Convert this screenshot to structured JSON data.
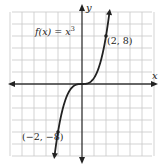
{
  "chart_data": {
    "type": "line",
    "title": "",
    "function_label": "f(x) = x",
    "function_exponent": "3",
    "xlabel": "x",
    "ylabel": "y",
    "x_unit_per_grid": 1,
    "y_unit_per_grid": 2,
    "xlim": [
      -6,
      6
    ],
    "ylim": [
      -12,
      12
    ],
    "grid": true,
    "series": [
      {
        "name": "f(x) = x^3",
        "x": [
          -2.3,
          -2,
          -1.5,
          -1,
          -0.5,
          0,
          0.5,
          1,
          1.5,
          2,
          2.3
        ],
        "y": [
          -12.17,
          -8,
          -3.375,
          -1,
          -0.125,
          0,
          0.125,
          1,
          3.375,
          8,
          12.17
        ]
      }
    ],
    "annotations": [
      {
        "point": [
          2,
          8
        ],
        "text": "(2, 8)"
      },
      {
        "point": [
          -2,
          -8
        ],
        "text": "(−2, −8)"
      }
    ]
  },
  "colors": {
    "grid": "#c8c8c8",
    "axis": "#333333",
    "curve": "#222222",
    "background": "#ffffff"
  }
}
